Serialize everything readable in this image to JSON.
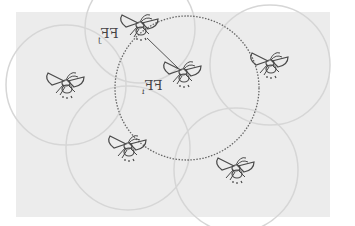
{
  "diagram": {
    "colors": {
      "background": "#ececec",
      "firefly_stroke": "#4a4a4a",
      "range_circle": "#d8d8d8",
      "dotted_circle": "#666666"
    },
    "labels": {
      "ffj": {
        "text": "FF",
        "sub": "j"
      },
      "ffi": {
        "text": "FF",
        "sub": "i"
      }
    },
    "fireflies": [
      {
        "id": "ffj",
        "x": 140,
        "y": 28
      },
      {
        "id": "ffi",
        "x": 183,
        "y": 75
      },
      {
        "id": "left",
        "x": 66,
        "y": 85
      },
      {
        "id": "right",
        "x": 270,
        "y": 65
      },
      {
        "id": "bottom-left",
        "x": 128,
        "y": 148
      },
      {
        "id": "bottom-right",
        "x": 236,
        "y": 170
      }
    ],
    "main_circle": {
      "cx": 187,
      "cy": 88,
      "r": 72,
      "style": "dotted"
    },
    "connection": {
      "from": "ffj",
      "to": "ffi"
    }
  }
}
